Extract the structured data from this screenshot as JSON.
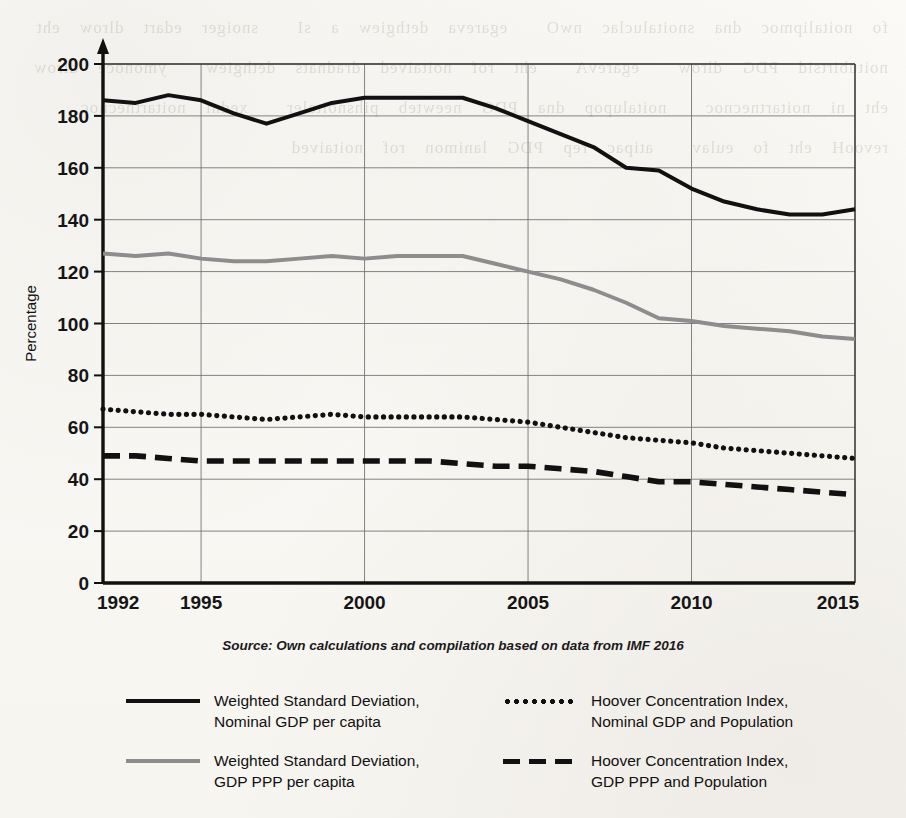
{
  "figure": {
    "source_note": "Source: Own calculations and compilation based on data from IMF 2016",
    "paper_bleed": "fo noitalipmoc dna snoitaluclac nwO  egareva dethgiew a sI  snoiger edart dlrow eht  noitubirtsid PDG dlrow  egarevA  eht rof noitaived dradnats dethgiew  ymonoce dlrow eht ni noitartnecnoc  noitalupop dna PDG neewteb pihsnoitaler  xedni noitartnecnoc revooH eht fo eulav  atipac rep PDG lanimon rof noitaived"
  },
  "chart_data": {
    "type": "line",
    "title": "",
    "xlabel": "",
    "ylabel": "Percentage",
    "xlim": [
      1992,
      2015
    ],
    "ylim": [
      0,
      200
    ],
    "ytick_step": 20,
    "yticks": [
      0,
      20,
      40,
      60,
      80,
      100,
      120,
      140,
      160,
      180,
      200
    ],
    "xticks": [
      1992,
      1995,
      2000,
      2005,
      2010,
      2015
    ],
    "xtick_labels": [
      "1992",
      "1995",
      "2000",
      "2005",
      "2010",
      "2015"
    ],
    "ytick_labels": [
      "0",
      "20",
      "40",
      "60",
      "80",
      "100",
      "120",
      "140",
      "160",
      "180",
      "200"
    ],
    "grid": true,
    "grid_axis": "both",
    "legend_position": "bottom",
    "x": [
      1992,
      1993,
      1994,
      1995,
      1996,
      1997,
      1998,
      1999,
      2000,
      2001,
      2002,
      2003,
      2004,
      2005,
      2006,
      2007,
      2008,
      2009,
      2010,
      2011,
      2012,
      2013,
      2014,
      2015
    ],
    "series": [
      {
        "name": "Weighted Standard Deviation, Nominal GDP per capita",
        "style": "solid",
        "color": "#111111",
        "width": 4,
        "values": [
          186,
          185,
          188,
          186,
          181,
          177,
          181,
          185,
          187,
          187,
          187,
          187,
          183,
          178,
          173,
          168,
          160,
          159,
          152,
          147,
          144,
          142,
          142,
          144
        ]
      },
      {
        "name": "Weighted Standard Deviation, GDP PPP per capita",
        "style": "solid",
        "color": "#8d8d8d",
        "width": 4,
        "values": [
          127,
          126,
          127,
          125,
          124,
          124,
          125,
          126,
          125,
          126,
          126,
          126,
          123,
          120,
          117,
          113,
          108,
          102,
          101,
          99,
          98,
          97,
          95,
          94
        ]
      },
      {
        "name": "Hoover Concentration Index, Nominal GDP and Population",
        "style": "dotted",
        "color": "#111111",
        "width": 5,
        "values": [
          67,
          66,
          65,
          65,
          64,
          63,
          64,
          65,
          64,
          64,
          64,
          64,
          63,
          62,
          60,
          58,
          56,
          55,
          54,
          52,
          51,
          50,
          49,
          48
        ]
      },
      {
        "name": "Hoover Concentration Index, GDP PPP and Population",
        "style": "dashed",
        "color": "#111111",
        "width": 5,
        "values": [
          49,
          49,
          48,
          47,
          47,
          47,
          47,
          47,
          47,
          47,
          47,
          46,
          45,
          45,
          44,
          43,
          41,
          39,
          39,
          38,
          37,
          36,
          35,
          34
        ]
      }
    ]
  },
  "legend": {
    "entries": [
      {
        "style_key": "sw-solid-black",
        "icon": "solid-black-line-icon",
        "line1": "Weighted Standard Deviation,",
        "line2": "Nominal GDP per capita"
      },
      {
        "style_key": "sw-dotted",
        "icon": "dotted-black-line-icon",
        "line1": "Hoover Concentration Index,",
        "line2": "Nominal GDP and Population"
      },
      {
        "style_key": "sw-solid-gray",
        "icon": "solid-gray-line-icon",
        "line1": "Weighted Standard Deviation,",
        "line2": "GDP PPP per capita"
      },
      {
        "style_key": "sw-dashed",
        "icon": "dashed-black-line-icon",
        "line1": "Hoover Concentration Index,",
        "line2": "GDP PPP and Population"
      }
    ]
  }
}
